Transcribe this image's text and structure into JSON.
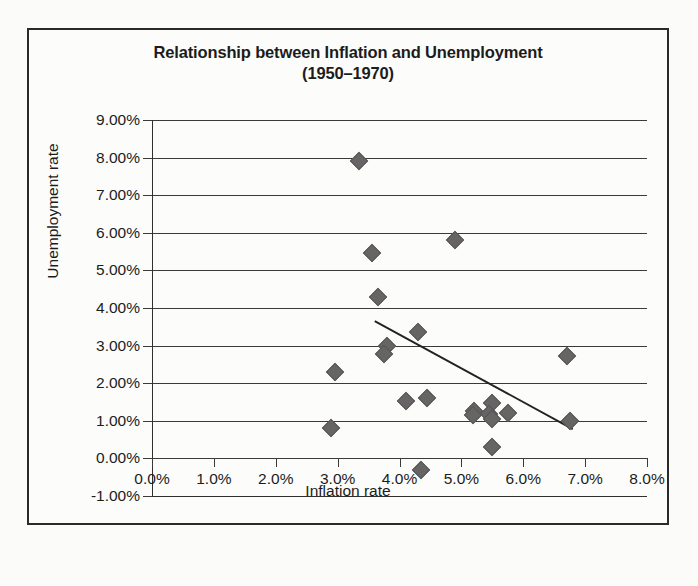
{
  "chart_data": {
    "type": "scatter",
    "title": "Relationship between Inflation and Unemployment (1950–1970)",
    "title_line1": "Relationship between Inflation and Unemployment",
    "title_line2": "(1950–1970)",
    "xlabel": "Inflation rate",
    "ylabel": "Unemployment rate",
    "xlim": [
      0.0,
      8.0
    ],
    "ylim": [
      -1.0,
      9.0
    ],
    "x_tick_labels": [
      "0.0%",
      "1.0%",
      "2.0%",
      "3.0%",
      "4.0%",
      "5.0%",
      "6.0%",
      "7.0%",
      "8.0%"
    ],
    "x_tick_values": [
      0.0,
      1.0,
      2.0,
      3.0,
      4.0,
      5.0,
      6.0,
      7.0,
      8.0
    ],
    "y_tick_labels": [
      "9.00%",
      "8.00%",
      "7.00%",
      "6.00%",
      "5.00%",
      "4.00%",
      "3.00%",
      "2.00%",
      "1.00%",
      "0.00%",
      "-1.00%"
    ],
    "y_tick_values": [
      9.0,
      8.0,
      7.0,
      6.0,
      5.0,
      4.0,
      3.0,
      2.0,
      1.0,
      0.0,
      -1.0
    ],
    "grid": "horizontal",
    "legend": "none",
    "marker_color": "#666464",
    "gridline_color": "#3a3a3a",
    "axis_color": "#2f2f2f",
    "points": [
      {
        "x": 3.35,
        "y": 7.9
      },
      {
        "x": 4.9,
        "y": 5.82
      },
      {
        "x": 3.55,
        "y": 5.45
      },
      {
        "x": 3.65,
        "y": 4.28
      },
      {
        "x": 4.3,
        "y": 3.35
      },
      {
        "x": 3.8,
        "y": 3.0
      },
      {
        "x": 3.75,
        "y": 2.78
      },
      {
        "x": 6.7,
        "y": 2.72
      },
      {
        "x": 2.95,
        "y": 2.3
      },
      {
        "x": 4.45,
        "y": 1.6
      },
      {
        "x": 4.1,
        "y": 1.52
      },
      {
        "x": 5.5,
        "y": 1.48
      },
      {
        "x": 5.2,
        "y": 1.25
      },
      {
        "x": 5.18,
        "y": 1.15
      },
      {
        "x": 5.75,
        "y": 1.22
      },
      {
        "x": 5.45,
        "y": 1.18
      },
      {
        "x": 5.5,
        "y": 1.05
      },
      {
        "x": 6.75,
        "y": 1.0
      },
      {
        "x": 2.9,
        "y": 0.8
      },
      {
        "x": 5.5,
        "y": 0.3
      },
      {
        "x": 4.35,
        "y": -0.3
      }
    ],
    "trendline": {
      "visible": true,
      "x0": 3.6,
      "y0": 3.65,
      "x1": 6.8,
      "y1": 0.78,
      "color": "#222222"
    }
  }
}
